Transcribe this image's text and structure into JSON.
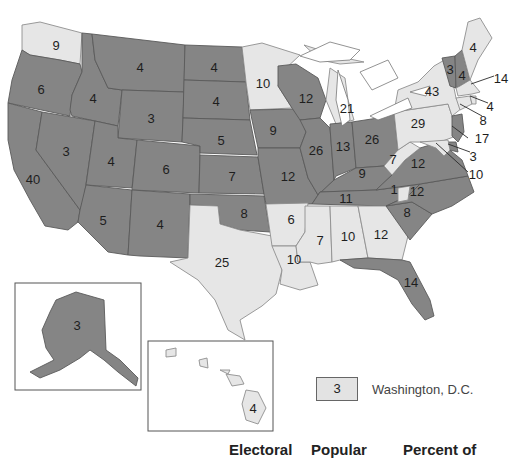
{
  "colors": {
    "dark_states": "#858585",
    "light_states": "#e6e6e6",
    "background": "#ffffff"
  },
  "states": {
    "WA": "9",
    "OR": "6",
    "CA": "40",
    "ID": "4",
    "NV": "3",
    "MT": "4",
    "WY": "3",
    "UT": "4",
    "AZ": "5",
    "CO": "6",
    "NM": "4",
    "ND": "4",
    "SD": "4",
    "NE": "5",
    "KS": "7",
    "OK": "8",
    "TX": "25",
    "MN": "10",
    "IA": "9",
    "MO": "12",
    "AR": "6",
    "LA": "10",
    "WI": "12",
    "IL": "26",
    "MI": "21",
    "IN": "13",
    "OH": "26",
    "KY": "9",
    "TN": "11",
    "MS": "7",
    "AL": "10",
    "GA": "12",
    "FL": "14",
    "SC": "8",
    "NC": "12",
    "VA": "12",
    "WV": "7",
    "PA": "29",
    "NY": "43",
    "VT": "3",
    "NH": "4",
    "ME": "4",
    "MA": "14",
    "RI": "4",
    "CT": "8",
    "NJ": "17",
    "DE": "3",
    "MD": "10",
    "AK": "3",
    "HI": "4",
    "NC_split": "1"
  },
  "legend": {
    "dc_value": "3",
    "dc_label": "Washington, D.C."
  },
  "table_headers": {
    "col1": "Electoral",
    "col2": "Popular",
    "col3": "Percent of"
  }
}
